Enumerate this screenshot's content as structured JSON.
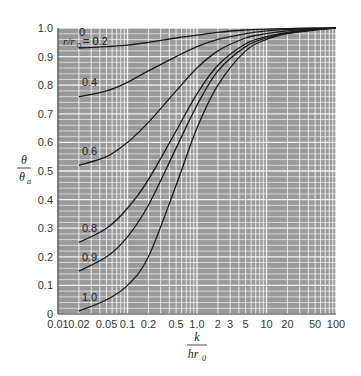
{
  "chart_data": {
    "type": "line",
    "title": "",
    "xlabel": "k / (h r0)",
    "ylabel": "θ / θa",
    "xscale": "log",
    "xlim": [
      0.01,
      100
    ],
    "ylim": [
      0,
      1.0
    ],
    "grid": true,
    "background": "#9a9a9a",
    "grid_color": "#ffffff",
    "line_color": "#1a1a1a",
    "x_ticks": [
      0.01,
      0.02,
      0.05,
      0.1,
      0.2,
      0.5,
      1.0,
      2,
      3,
      5,
      10,
      20,
      50,
      100
    ],
    "x_tick_labels": [
      "0.01",
      "0.02",
      "0.05",
      "0.1",
      "0.2",
      "0.5",
      "1.0",
      "2",
      "3",
      "5",
      "10",
      "20",
      "50",
      "100"
    ],
    "y_ticks": [
      0,
      0.1,
      0.2,
      0.3,
      0.4,
      0.5,
      0.6,
      0.7,
      0.8,
      0.9,
      1.0
    ],
    "y_tick_labels": [
      "0",
      "0.1",
      "0.2",
      "0.3",
      "0.4",
      "0.5",
      "0.6",
      "0.7",
      "0.8",
      "0.9",
      "1.0"
    ],
    "x": [
      0.02,
      0.05,
      0.1,
      0.2,
      0.5,
      1,
      2,
      5,
      10,
      20,
      50,
      100
    ],
    "series": [
      {
        "name": "r/r0 = 0",
        "label": "0",
        "values": [
          1.0,
          1.0,
          1.0,
          1.0,
          1.0,
          1.0,
          1.0,
          1.0,
          1.0,
          1.0,
          1.0,
          1.0
        ]
      },
      {
        "name": "r/r0 = 0.2",
        "label": "0.2",
        "values": [
          0.93,
          0.935,
          0.94,
          0.95,
          0.965,
          0.975,
          0.985,
          0.993,
          0.996,
          0.998,
          1.0,
          1.0
        ]
      },
      {
        "name": "r/r0 = 0.4",
        "label": "0.4",
        "values": [
          0.76,
          0.78,
          0.81,
          0.85,
          0.9,
          0.935,
          0.96,
          0.98,
          0.99,
          0.995,
          0.998,
          1.0
        ]
      },
      {
        "name": "r/r0 = 0.6",
        "label": "0.6",
        "values": [
          0.52,
          0.55,
          0.6,
          0.67,
          0.78,
          0.86,
          0.92,
          0.965,
          0.98,
          0.99,
          0.997,
          1.0
        ]
      },
      {
        "name": "r/r0 = 0.8",
        "label": "0.8",
        "values": [
          0.25,
          0.3,
          0.37,
          0.47,
          0.64,
          0.77,
          0.87,
          0.945,
          0.97,
          0.985,
          0.995,
          1.0
        ]
      },
      {
        "name": "r/r0 = 0.9",
        "label": "0.9",
        "values": [
          0.15,
          0.2,
          0.27,
          0.38,
          0.58,
          0.73,
          0.85,
          0.935,
          0.965,
          0.982,
          0.994,
          1.0
        ]
      },
      {
        "name": "r/r0 = 1.0",
        "label": "1.0",
        "values": [
          0.01,
          0.05,
          0.1,
          0.2,
          0.45,
          0.65,
          0.8,
          0.92,
          0.96,
          0.98,
          0.993,
          1.0
        ]
      }
    ],
    "annotations": [
      {
        "text": "r/r0 = 0.2",
        "x": 0.02,
        "y": 0.95
      },
      {
        "text": "0",
        "x": 0.02,
        "y": 0.99
      },
      {
        "text": "0.4",
        "x": 0.02,
        "y": 0.79
      },
      {
        "text": "0.6",
        "x": 0.02,
        "y": 0.55
      },
      {
        "text": "0.8",
        "x": 0.02,
        "y": 0.28
      },
      {
        "text": "0.9",
        "x": 0.02,
        "y": 0.18
      },
      {
        "text": "1.0",
        "x": 0.02,
        "y": 0.04
      }
    ]
  },
  "labels": {
    "y_num": "θ",
    "y_den": "θ",
    "y_den_sub": "a",
    "x_num": "k",
    "x_den": "hr",
    "x_den_sub": "0",
    "curve_prefix": "r/r",
    "curve_prefix_sub": "0",
    "curve_zero": "0",
    "curve_first": "= 0.2"
  }
}
